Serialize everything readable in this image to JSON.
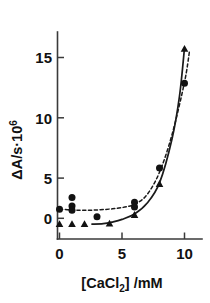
{
  "chart_data": {
    "type": "scatter",
    "title": "",
    "subtitle": "",
    "xlabel": "[CaCl2] /mM",
    "ylabel": "ΔA/s·10^6",
    "xlim": [
      -0.9,
      11.2
    ],
    "ylim": [
      -1.2,
      17.2
    ],
    "xticks": [
      0,
      5,
      10
    ],
    "xticklabels": [
      "0",
      "5",
      "10"
    ],
    "yticks": [
      0,
      5,
      10,
      15
    ],
    "yticklabels": [
      "0",
      "5",
      "10",
      "15"
    ],
    "grid": false,
    "legend": "none",
    "series": [
      {
        "name": "circles",
        "marker": "circle",
        "fit_style": "dashed",
        "points": [
          {
            "x": 0.0,
            "y": 0.85
          },
          {
            "x": 1.0,
            "y": 1.95
          },
          {
            "x": 1.0,
            "y": 1.15
          },
          {
            "x": 1.0,
            "y": 0.75
          },
          {
            "x": 3.0,
            "y": 0.15
          },
          {
            "x": 6.0,
            "y": 1.5
          },
          {
            "x": 6.0,
            "y": 1.05
          },
          {
            "x": 8.0,
            "y": 4.7
          },
          {
            "x": 10.0,
            "y": 12.6
          }
        ]
      },
      {
        "name": "triangles",
        "marker": "triangle",
        "fit_style": "solid",
        "points": [
          {
            "x": 0.0,
            "y": -0.55
          },
          {
            "x": 1.0,
            "y": -0.55
          },
          {
            "x": 2.0,
            "y": -0.55
          },
          {
            "x": 4.0,
            "y": -0.5
          },
          {
            "x": 6.0,
            "y": 0.3
          },
          {
            "x": 8.0,
            "y": 3.2
          },
          {
            "x": 10.0,
            "y": 15.8
          }
        ]
      }
    ],
    "fit_curves": [
      {
        "name": "dashed-fit",
        "style": "dashed",
        "points": [
          {
            "x": 0.0,
            "y": 0.85
          },
          {
            "x": 1.0,
            "y": 0.78
          },
          {
            "x": 2.0,
            "y": 0.75
          },
          {
            "x": 3.0,
            "y": 0.78
          },
          {
            "x": 4.0,
            "y": 0.86
          },
          {
            "x": 5.0,
            "y": 1.0
          },
          {
            "x": 6.0,
            "y": 1.3
          },
          {
            "x": 7.0,
            "y": 2.2
          },
          {
            "x": 8.0,
            "y": 4.3
          },
          {
            "x": 9.0,
            "y": 7.8
          },
          {
            "x": 10.0,
            "y": 12.7
          },
          {
            "x": 10.4,
            "y": 15.6
          }
        ]
      },
      {
        "name": "solid-fit",
        "style": "solid",
        "points": [
          {
            "x": 2.6,
            "y": -0.55
          },
          {
            "x": 3.5,
            "y": -0.5
          },
          {
            "x": 4.2,
            "y": -0.35
          },
          {
            "x": 5.0,
            "y": -0.1
          },
          {
            "x": 6.0,
            "y": 0.4
          },
          {
            "x": 7.0,
            "y": 1.4
          },
          {
            "x": 8.0,
            "y": 3.3
          },
          {
            "x": 9.0,
            "y": 7.4
          },
          {
            "x": 9.6,
            "y": 11.4
          },
          {
            "x": 10.0,
            "y": 15.9
          }
        ]
      }
    ],
    "colors": {
      "marker": "#121212",
      "axis": "#3a3a3a",
      "curve": "#1a1a1a",
      "background": "#ffffff"
    }
  },
  "labels": {
    "x_axis_main": "[CaCl",
    "x_axis_sub": "2",
    "x_axis_tail": "] /mM",
    "y_axis_main": "ΔA/s·10",
    "y_axis_sup": "6"
  }
}
